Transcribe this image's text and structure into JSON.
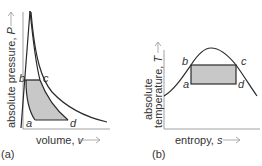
{
  "colors": {
    "curve": "#2a2a2a",
    "axis": "#777777",
    "fill": "#c8c8c8",
    "text": "#333333",
    "arrow": "#999999"
  },
  "panels": [
    {
      "id": "a",
      "caption": "(a)",
      "type": "P-v diagram",
      "x_axis": {
        "label": "volume, ",
        "var": "v",
        "arrow": "→"
      },
      "y_axis": {
        "label": "absolute pressure, ",
        "var": "P",
        "arrow": "→"
      },
      "points": {
        "a": "a",
        "b": "b",
        "c": "c",
        "d": "d"
      }
    },
    {
      "id": "b",
      "caption": "(b)",
      "type": "T-s diagram",
      "x_axis": {
        "label": "entropy, ",
        "var": "s",
        "arrow": "→"
      },
      "y_axis": {
        "label_line1": "absolute",
        "label_line2": "temperature, ",
        "var": "T",
        "arrow": "→"
      },
      "points": {
        "a": "a",
        "b": "b",
        "c": "c",
        "d": "d"
      }
    }
  ]
}
